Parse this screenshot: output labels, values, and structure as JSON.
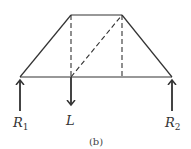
{
  "diagram": {
    "caption": "(b)",
    "labels": {
      "r1": "R",
      "r1_sub": "1",
      "load": "L",
      "r2": "R",
      "r2_sub": "2"
    },
    "colors": {
      "line": "#333333",
      "background": "#ffffff"
    },
    "geometry": {
      "top_left": [
        71,
        15
      ],
      "top_right": [
        122,
        15
      ],
      "bottom_left": [
        20,
        77
      ],
      "bottom_right": [
        172,
        77
      ]
    }
  }
}
